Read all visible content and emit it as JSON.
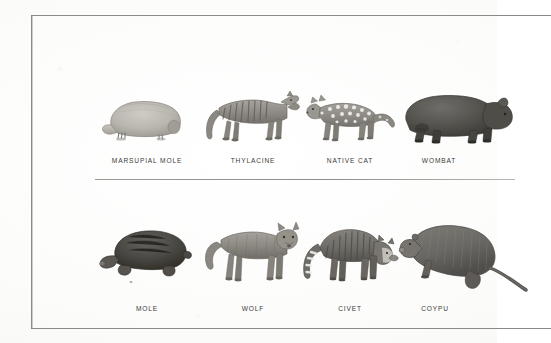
{
  "figure": {
    "background_color": "#fdfdfc",
    "frame_color": "#8a8a88",
    "caption_color": "#3a3a38",
    "divider_color": "#8d8d8b"
  },
  "rows": [
    {
      "id": "marsupials",
      "group_name": "marsupials",
      "cells": [
        {
          "label": "MARSUPIAL MOLE",
          "icon": "marsupial-mole-illustration",
          "tone": "#b9b6b0"
        },
        {
          "label": "THYLACINE",
          "icon": "thylacine-illustration",
          "tone": "#8d8a84"
        },
        {
          "label": "NATIVE CAT",
          "icon": "native-cat-illustration",
          "tone": "#8b8882"
        },
        {
          "label": "WOMBAT",
          "icon": "wombat-illustration",
          "tone": "#55534f"
        }
      ]
    },
    {
      "id": "placentals",
      "group_name": "placentals",
      "cells": [
        {
          "label": "MOLE",
          "icon": "mole-illustration",
          "tone": "#4b4945"
        },
        {
          "label": "WOLF",
          "icon": "wolf-illustration",
          "tone": "#8a8781"
        },
        {
          "label": "CIVET",
          "icon": "civet-illustration",
          "tone": "#6e6c67"
        },
        {
          "label": "COYPU",
          "icon": "coypu-illustration",
          "tone": "#6a6864"
        }
      ]
    }
  ]
}
